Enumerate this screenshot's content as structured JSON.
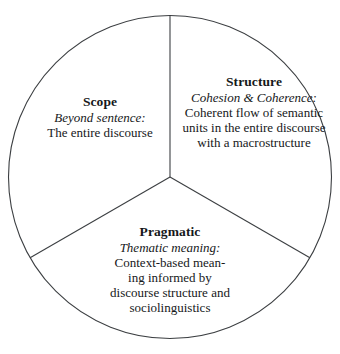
{
  "figure": {
    "shape": "circle-divided-into-three-sectors",
    "stroke_color": "#3c3f42",
    "background_color": "#ffffff"
  },
  "sectors": [
    {
      "id": "scope",
      "title": "Scope",
      "subtitle": "Beyond sentence:",
      "body": "The entire discourse"
    },
    {
      "id": "structure",
      "title": "Structure",
      "subtitle": "Cohesion & Coherence:",
      "body": "Coherent flow of semantic units in the entire discourse with a macrostructure"
    },
    {
      "id": "pragmatic",
      "title": "Pragmatic",
      "subtitle": "Thematic meaning:",
      "body": "Context-based mean-\ning informed by\ndiscourse structure and\nsociolinguistics"
    }
  ]
}
